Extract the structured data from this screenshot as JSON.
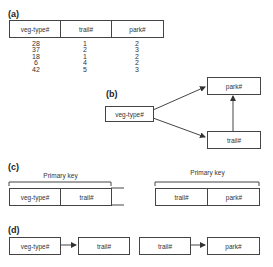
{
  "panels": {
    "a": {
      "label": "(a)",
      "headers": [
        "veg-type#",
        "trail#",
        "park#"
      ],
      "rows": [
        [
          "28",
          "1",
          "2"
        ],
        [
          "37",
          "2",
          "3"
        ],
        [
          "18",
          "1",
          "2"
        ],
        [
          "6",
          "4",
          "2"
        ],
        [
          "42",
          "5",
          "3"
        ]
      ],
      "columns_text": [
        "28\n37\n18\n6\n42",
        "1\n2\n1\n4\n5",
        "2\n3\n2\n2\n3"
      ]
    },
    "b": {
      "label": "(b)",
      "nodes": {
        "source": "veg-type#",
        "top": "park#",
        "bottom": "trail#"
      },
      "edges": [
        {
          "from": "veg-type#",
          "to": "park#"
        },
        {
          "from": "veg-type#",
          "to": "trail#"
        },
        {
          "from": "trail#",
          "to": "park#"
        }
      ]
    },
    "c": {
      "label": "(c)",
      "left": {
        "key_label": "Primary key",
        "attributes": [
          "veg-type#",
          "trail#"
        ]
      },
      "right": {
        "key_label": "Primary key",
        "attributes": [
          "trail#",
          "park#"
        ]
      }
    },
    "d": {
      "label": "(d)",
      "left": {
        "from": "veg-type#",
        "to": "trail#"
      },
      "right": {
        "from": "trail#",
        "to": "park#"
      }
    }
  },
  "colors": {
    "line": "#444444",
    "text": "#333333",
    "background": "#ffffff"
  }
}
